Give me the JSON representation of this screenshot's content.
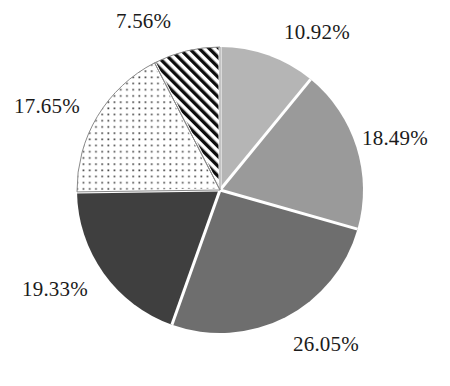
{
  "chart_data": {
    "type": "pie",
    "title": "",
    "xlabel": "",
    "ylabel": "",
    "legend": "none",
    "grid": false,
    "units": "percent",
    "start_angle_deg": 0,
    "direction": "clockwise",
    "center": {
      "x": 220,
      "y": 190
    },
    "radius": 143,
    "separator_color": "#ffffff",
    "background": "#ffffff",
    "label_color": "#1b1b1b",
    "categories": [
      "10.92%",
      "18.49%",
      "26.05%",
      "19.33%",
      "17.65%",
      "7.56%"
    ],
    "values": [
      10.92,
      18.49,
      26.05,
      19.33,
      17.65,
      7.56
    ],
    "slices": [
      {
        "label": "10.92%",
        "value": 10.92,
        "fill": "#b5b5b5",
        "pattern": "solid",
        "start_deg": 0.0,
        "end_deg": 39.31
      },
      {
        "label": "18.49%",
        "value": 18.49,
        "fill": "#9a9a9a",
        "pattern": "solid",
        "start_deg": 39.31,
        "end_deg": 105.87
      },
      {
        "label": "26.05%",
        "value": 26.05,
        "fill": "#6e6e6e",
        "pattern": "solid",
        "start_deg": 105.87,
        "end_deg": 199.65
      },
      {
        "label": "19.33%",
        "value": 19.33,
        "fill": "#3f3f3f",
        "pattern": "solid",
        "start_deg": 199.65,
        "end_deg": 269.24
      },
      {
        "label": "17.65%",
        "value": 17.65,
        "fill": "#ffffff",
        "pattern": "dots",
        "start_deg": 269.24,
        "end_deg": 332.78
      },
      {
        "label": "7.56%",
        "value": 7.56,
        "fill": "#ffffff",
        "pattern": "diagonal-hatch",
        "start_deg": 332.78,
        "end_deg": 360.0
      }
    ]
  },
  "labels": {
    "slice_1": "10.92%",
    "slice_2": "18.49%",
    "slice_3": "26.05%",
    "slice_4": "19.33%",
    "slice_5": "17.65%",
    "slice_6": "7.56%"
  }
}
